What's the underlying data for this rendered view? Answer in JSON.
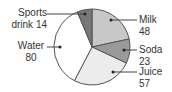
{
  "chart_data": {
    "type": "pie",
    "title": "",
    "categories": [
      "Milk",
      "Soda",
      "Juice",
      "Water",
      "Sports drink"
    ],
    "values": [
      48,
      23,
      57,
      80,
      14
    ],
    "colors": [
      "#c8c8c8",
      "#9a9a9a",
      "#ececec",
      "#ffffff",
      "#777777"
    ],
    "start_angle_deg": 0,
    "direction": "clockwise",
    "labels": [
      {
        "name": "Milk",
        "value": "48"
      },
      {
        "name": "Soda",
        "value": "23"
      },
      {
        "name": "Juice",
        "value": "57"
      },
      {
        "name": "Water",
        "value": "80"
      },
      {
        "name": "Sports drink",
        "value": "14"
      }
    ]
  },
  "labels_text": {
    "sports_line1": "Sports",
    "sports_line2": "drink 14",
    "water_name": "Water",
    "water_value": "80",
    "milk_name": "Milk",
    "milk_value": "48",
    "soda_name": "Soda",
    "soda_value": "23",
    "juice_name": "Juice",
    "juice_value": "57"
  }
}
